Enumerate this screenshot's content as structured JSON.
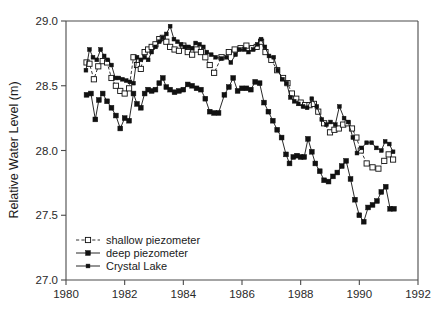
{
  "figure": {
    "ylabel": "Relative Water Level (m)",
    "xlabel": ""
  },
  "legend": {
    "items": [
      {
        "label": "shallow piezometer",
        "style": "dashed-open-square"
      },
      {
        "label": "deep piezometer",
        "style": "solid-filled-square"
      },
      {
        "label": "Crystal Lake",
        "style": "solid-filled-dot"
      }
    ]
  },
  "axes": {
    "x_ticks": [
      "1980",
      "1982",
      "1984",
      "1986",
      "1988",
      "1990",
      "1992"
    ],
    "y_ticks": [
      "27.0",
      "27.5",
      "28.0",
      "28.5",
      "29.0"
    ]
  },
  "chart_data": {
    "type": "line",
    "title": "",
    "xlabel": "",
    "ylabel": "Relative Water Level (m)",
    "xlim": [
      1980,
      1992
    ],
    "ylim": [
      27.0,
      29.0
    ],
    "x_ticks": [
      1980,
      1982,
      1984,
      1986,
      1988,
      1990,
      1992
    ],
    "y_ticks": [
      27.0,
      27.5,
      28.0,
      28.5,
      29.0
    ],
    "grid": false,
    "legend_position": "lower-left",
    "series": [
      {
        "name": "shallow piezometer",
        "marker": "open-square",
        "linestyle": "dashed",
        "color": "#111111",
        "x": [
          1980.7,
          1980.8,
          1980.95,
          1981.1,
          1981.25,
          1981.4,
          1981.55,
          1981.7,
          1981.85,
          1982.0,
          1982.15,
          1982.3,
          1982.42,
          1982.55,
          1982.68,
          1982.8,
          1982.92,
          1983.05,
          1983.18,
          1983.3,
          1983.42,
          1983.55,
          1983.7,
          1983.85,
          1984.0,
          1984.15,
          1984.3,
          1984.45,
          1984.6,
          1984.75,
          1984.9,
          1985.05,
          1985.3,
          1985.55,
          1985.75,
          1985.95,
          1986.15,
          1986.35,
          1986.5,
          1986.65,
          1986.8,
          1987.0,
          1987.2,
          1987.4,
          1987.55,
          1987.7,
          1987.85,
          1988.0,
          1988.15,
          1988.3,
          1988.45,
          1988.6,
          1988.8,
          1989.0,
          1989.15,
          1989.3,
          1989.45,
          1989.6,
          1989.75,
          1989.9,
          1990.05,
          1990.25,
          1990.45,
          1990.65,
          1990.85,
          1991.0,
          1991.15
        ],
        "y": [
          28.68,
          28.67,
          28.55,
          28.65,
          28.69,
          28.68,
          28.56,
          28.5,
          28.46,
          28.44,
          28.48,
          28.72,
          28.66,
          28.63,
          28.76,
          28.78,
          28.8,
          28.82,
          28.86,
          28.87,
          28.84,
          28.8,
          28.78,
          28.77,
          28.81,
          28.76,
          28.74,
          28.78,
          28.76,
          28.72,
          28.66,
          28.6,
          28.72,
          28.76,
          28.78,
          28.79,
          28.81,
          28.79,
          28.8,
          28.84,
          28.76,
          28.7,
          28.62,
          28.56,
          28.52,
          28.44,
          28.4,
          28.37,
          28.35,
          28.35,
          28.36,
          28.3,
          28.21,
          28.14,
          28.16,
          28.17,
          28.2,
          28.21,
          28.17,
          28.1,
          28.0,
          27.9,
          27.87,
          27.86,
          27.92,
          27.97,
          27.93
        ]
      },
      {
        "name": "deep piezometer",
        "marker": "filled-square",
        "linestyle": "solid",
        "color": "#111111",
        "x": [
          1980.7,
          1980.85,
          1981.0,
          1981.12,
          1981.25,
          1981.4,
          1981.55,
          1981.7,
          1981.85,
          1982.0,
          1982.15,
          1982.3,
          1982.42,
          1982.55,
          1982.68,
          1982.8,
          1982.92,
          1983.05,
          1983.18,
          1983.3,
          1983.42,
          1983.55,
          1983.7,
          1983.85,
          1984.0,
          1984.15,
          1984.3,
          1984.45,
          1984.6,
          1984.75,
          1984.9,
          1985.05,
          1985.2,
          1985.4,
          1985.55,
          1985.7,
          1985.85,
          1986.0,
          1986.15,
          1986.3,
          1986.45,
          1986.6,
          1986.75,
          1986.9,
          1987.05,
          1987.2,
          1987.35,
          1987.5,
          1987.62,
          1987.75,
          1987.88,
          1988.0,
          1988.12,
          1988.25,
          1988.38,
          1988.5,
          1988.65,
          1988.8,
          1988.95,
          1989.1,
          1989.25,
          1989.4,
          1989.55,
          1989.7,
          1989.85,
          1990.0,
          1990.15,
          1990.3,
          1990.45,
          1990.6,
          1990.75,
          1990.9,
          1991.05,
          1991.18
        ],
        "y": [
          28.43,
          28.44,
          28.24,
          28.39,
          28.44,
          28.38,
          28.33,
          28.27,
          28.17,
          28.25,
          28.23,
          28.44,
          28.36,
          28.33,
          28.44,
          28.47,
          28.46,
          28.47,
          28.52,
          28.56,
          28.49,
          28.47,
          28.45,
          28.46,
          28.47,
          28.51,
          28.5,
          28.48,
          28.47,
          28.4,
          28.3,
          28.29,
          28.29,
          28.43,
          28.49,
          28.56,
          28.46,
          28.48,
          28.48,
          28.47,
          28.53,
          28.52,
          28.37,
          28.3,
          28.23,
          28.16,
          28.1,
          27.97,
          27.9,
          27.95,
          27.96,
          27.95,
          27.95,
          28.09,
          27.99,
          27.9,
          27.84,
          27.77,
          27.76,
          27.8,
          27.83,
          27.88,
          27.92,
          27.78,
          27.62,
          27.5,
          27.45,
          27.56,
          27.58,
          27.61,
          27.68,
          27.72,
          27.55,
          27.55
        ]
      },
      {
        "name": "Crystal Lake",
        "marker": "filled-dot",
        "linestyle": "solid",
        "color": "#111111",
        "x": [
          1980.68,
          1980.8,
          1980.92,
          1981.05,
          1981.18,
          1981.3,
          1981.42,
          1981.55,
          1981.68,
          1981.8,
          1981.92,
          1982.05,
          1982.18,
          1982.3,
          1982.42,
          1982.55,
          1982.68,
          1982.8,
          1982.92,
          1983.05,
          1983.18,
          1983.3,
          1983.42,
          1983.55,
          1983.68,
          1983.8,
          1983.92,
          1984.05,
          1984.18,
          1984.3,
          1984.42,
          1984.55,
          1984.68,
          1984.8,
          1984.95,
          1985.1,
          1985.3,
          1985.48,
          1985.62,
          1985.78,
          1985.92,
          1986.08,
          1986.22,
          1986.38,
          1986.52,
          1986.65,
          1986.78,
          1986.92,
          1987.08,
          1987.22,
          1987.38,
          1987.52,
          1987.65,
          1987.78,
          1987.92,
          1988.08,
          1988.22,
          1988.38,
          1988.55,
          1988.72,
          1988.88,
          1989.02,
          1989.18,
          1989.32,
          1989.48,
          1989.62,
          1989.78,
          1989.92,
          1990.08,
          1990.25,
          1990.42,
          1990.58,
          1990.75,
          1990.88,
          1991.02,
          1991.15
        ],
        "y": [
          28.62,
          28.78,
          28.72,
          28.7,
          28.78,
          28.73,
          28.7,
          28.66,
          28.56,
          28.56,
          28.55,
          28.54,
          28.53,
          28.52,
          28.72,
          28.7,
          28.72,
          28.7,
          28.76,
          28.8,
          28.84,
          28.87,
          28.9,
          28.96,
          28.86,
          28.84,
          28.82,
          28.8,
          28.8,
          28.79,
          28.83,
          28.82,
          28.8,
          28.76,
          28.74,
          28.72,
          28.71,
          28.72,
          28.68,
          28.74,
          28.78,
          28.78,
          28.76,
          28.78,
          28.82,
          28.86,
          28.8,
          28.73,
          28.72,
          28.62,
          28.55,
          28.52,
          28.41,
          28.38,
          28.36,
          28.34,
          28.33,
          28.4,
          28.34,
          28.24,
          28.2,
          28.22,
          28.2,
          28.34,
          28.25,
          28.22,
          28.1,
          27.98,
          28.02,
          28.06,
          28.06,
          28.02,
          28.0,
          28.07,
          28.05,
          27.99
        ]
      }
    ]
  }
}
